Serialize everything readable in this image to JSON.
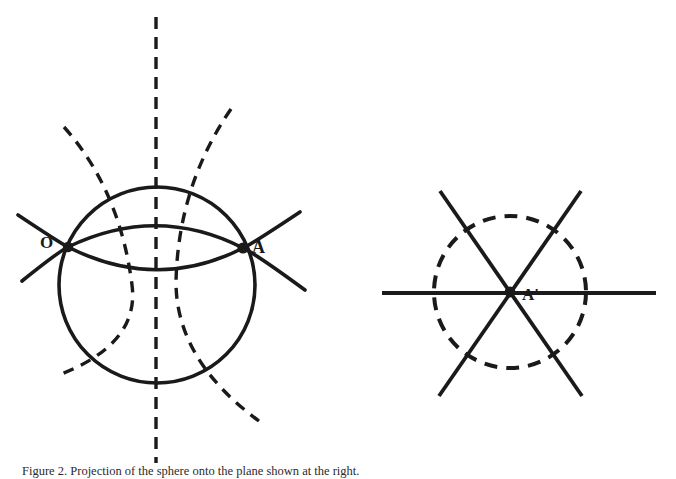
{
  "figure": {
    "type": "geometric-line-diagram",
    "background_color": "#ffffff",
    "stroke_color": "#1a1a1a",
    "labels": {
      "left_diagram_point_o": "O",
      "left_diagram_point_a": "A",
      "right_diagram_point_a_prime": "A'"
    },
    "caption": "Figure 2.  Projection of the sphere onto the plane shown at the right.",
    "left_diagram": {
      "name": "sphere-with-meridians",
      "solid_circle": {
        "cx": 157,
        "cy": 285,
        "r": 98
      },
      "solid_arc_upper": {
        "from_x": 18,
        "from_y": 215,
        "to_x": 300,
        "to_y": 212
      },
      "solid_arc_lower": {
        "from_x": 22,
        "from_y": 281,
        "to_x": 305,
        "to_y": 290
      },
      "dashed_vertical_axis": {
        "x": 156,
        "y_top": 17,
        "y_bottom": 463
      },
      "dashed_meridian_left": {
        "from_x": 64,
        "from_y": 127,
        "to_x": 56,
        "to_y": 376
      },
      "dashed_meridian_right": {
        "from_x": 231,
        "from_y": 109,
        "to_x": 259,
        "to_y": 421
      },
      "point_o": {
        "x": 68,
        "y": 247
      },
      "point_a": {
        "x": 243,
        "y": 248
      }
    },
    "right_diagram": {
      "name": "projected-plane-with-three-lines",
      "dashed_circle": {
        "cx": 510,
        "cy": 292,
        "r": 76
      },
      "horizontal_line": {
        "x1": 382,
        "y1": 293,
        "x2": 656,
        "y2": 293
      },
      "diagonal_line_1": {
        "x1": 440,
        "y1": 191,
        "x2": 582,
        "y2": 396
      },
      "diagonal_line_2": {
        "x1": 581,
        "y1": 191,
        "x2": 439,
        "y2": 396
      },
      "center_point": {
        "x": 510,
        "y": 292
      }
    }
  }
}
